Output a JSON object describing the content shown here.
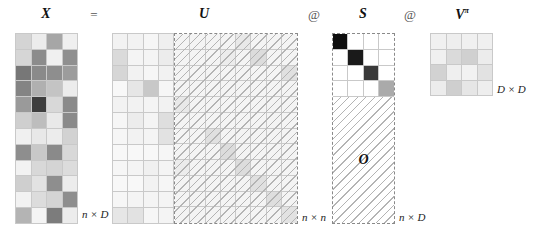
{
  "labels": {
    "X": "X",
    "equals": "=",
    "U": "U",
    "at1": "@",
    "S": "S",
    "at2": "@",
    "V": "V",
    "V_sup": "π",
    "O": "O",
    "dim_X": "n × D",
    "dim_U": "n × n",
    "dim_S": "n × D",
    "dim_V": "D × D"
  },
  "matrices": {
    "X": {
      "rows": 12,
      "cols": 4,
      "cells": [
        [
          "#d4d4d4",
          "#ececec",
          "#a6a6a6",
          "#efefef"
        ],
        [
          "#d6d6d6",
          "#8c8c8c",
          "#f0f0f0",
          "#8f8f8f"
        ],
        [
          "#777777",
          "#8a8a8a",
          "#8e8e8e",
          "#9c9c9c"
        ],
        [
          "#848484",
          "#b0b0b0",
          "#c4c4c4",
          "#ececec"
        ],
        [
          "#9a9a9a",
          "#3e3e3e",
          "#d8d8d8",
          "#8a8a8a"
        ],
        [
          "#cfcfcf",
          "#bdbdbd",
          "#e9e9e9",
          "#8a8a8a"
        ],
        [
          "#f0f0f0",
          "#e8e8e8",
          "#ececec",
          "#d2d2d2"
        ],
        [
          "#8e8e8e",
          "#c8c8c8",
          "#8a8a8a",
          "#d8d8d8"
        ],
        [
          "#f2f2f2",
          "#d8d8d8",
          "#d4d4d4",
          "#dcdcdc"
        ],
        [
          "#cfcfcf",
          "#e2e2e2",
          "#8e8e8e",
          "#ececec"
        ],
        [
          "#f2f2f2",
          "#dcdcdc",
          "#d4d4d4",
          "#8e8e8e"
        ],
        [
          "#b4b4b4",
          "#f4f4f4",
          "#7c7c7c",
          "#ececec"
        ]
      ]
    },
    "U_left": {
      "rows": 12,
      "cols": 4,
      "cells": [
        [
          "#f2f2f2",
          "#f2f2f2",
          "#f6f6f6",
          "#efefef"
        ],
        [
          "#dadada",
          "#f4f4f4",
          "#f4f4f4",
          "#ececec"
        ],
        [
          "#d6d6d6",
          "#f2f2f2",
          "#f6f6f6",
          "#f2f2f2"
        ],
        [
          "#f8f8f8",
          "#e6e6e6",
          "#c8c8c8",
          "#f6f6f6"
        ],
        [
          "#f2f2f2",
          "#f2f2f2",
          "#f4f4f4",
          "#f2f2f2"
        ],
        [
          "#f6f6f6",
          "#ececec",
          "#f4f4f4",
          "#dedede"
        ],
        [
          "#f6f6f6",
          "#f2f2f2",
          "#f4f4f4",
          "#e2e2e2"
        ],
        [
          "#f8f8f8",
          "#f8f8f8",
          "#f8f8f8",
          "#f6f6f6"
        ],
        [
          "#f6f6f6",
          "#f4f4f4",
          "#f0f0f0",
          "#f4f4f4"
        ],
        [
          "#f8f8f8",
          "#f8f8f8",
          "#f2f2f2",
          "#f6f6f6"
        ],
        [
          "#f6f6f6",
          "#f4f4f4",
          "#f4f4f4",
          "#f4f4f4"
        ],
        [
          "#e6e6e6",
          "#e2e2e2",
          "#f6f6f6",
          "#f4f4f4"
        ]
      ]
    },
    "U_right": {
      "rows": 12,
      "cols": 8,
      "cells": [
        [
          "#f4f4f4",
          "#f4f4f4",
          "#f4f4f4",
          "#f4f4f4",
          "#e8e8e8",
          "#f4f4f4",
          "#f4f4f4",
          "#f4f4f4"
        ],
        [
          "#f4f4f4",
          "#f4f4f4",
          "#f4f4f4",
          "#ececec",
          "#f4f4f4",
          "#dcdcdc",
          "#f4f4f4",
          "#f4f4f4"
        ],
        [
          "#f4f4f4",
          "#f4f4f4",
          "#f4f4f4",
          "#f4f4f4",
          "#f4f4f4",
          "#f4f4f4",
          "#f4f4f4",
          "#e0e0e0"
        ],
        [
          "#f4f4f4",
          "#f4f4f4",
          "#f4f4f4",
          "#f4f4f4",
          "#f4f4f4",
          "#f4f4f4",
          "#f4f4f4",
          "#f4f4f4"
        ],
        [
          "#e8e8e8",
          "#f4f4f4",
          "#f4f4f4",
          "#f4f4f4",
          "#f4f4f4",
          "#f4f4f4",
          "#f4f4f4",
          "#f4f4f4"
        ],
        [
          "#f4f4f4",
          "#f4f4f4",
          "#f4f4f4",
          "#f4f4f4",
          "#f4f4f4",
          "#f4f4f4",
          "#f4f4f4",
          "#f4f4f4"
        ],
        [
          "#f4f4f4",
          "#f4f4f4",
          "#e0e0e0",
          "#f4f4f4",
          "#f4f4f4",
          "#f4f4f4",
          "#f4f4f4",
          "#f4f4f4"
        ],
        [
          "#f4f4f4",
          "#f4f4f4",
          "#f4f4f4",
          "#dcdcdc",
          "#f4f4f4",
          "#f4f4f4",
          "#f4f4f4",
          "#f4f4f4"
        ],
        [
          "#ececec",
          "#f4f4f4",
          "#f4f4f4",
          "#f4f4f4",
          "#dcdcdc",
          "#f4f4f4",
          "#f4f4f4",
          "#f4f4f4"
        ],
        [
          "#f4f4f4",
          "#f4f4f4",
          "#f4f4f4",
          "#f4f4f4",
          "#f4f4f4",
          "#e0e0e0",
          "#f4f4f4",
          "#f4f4f4"
        ],
        [
          "#f4f4f4",
          "#f4f4f4",
          "#f4f4f4",
          "#f4f4f4",
          "#f4f4f4",
          "#f4f4f4",
          "#dedede",
          "#f4f4f4"
        ],
        [
          "#f4f4f4",
          "#f4f4f4",
          "#f4f4f4",
          "#f4f4f4",
          "#f4f4f4",
          "#f4f4f4",
          "#f4f4f4",
          "#e2e2e2"
        ]
      ]
    },
    "S": {
      "rows": 4,
      "cols": 4,
      "cells": [
        [
          "#0e0e0e",
          "#ffffff",
          "#ffffff",
          "#ffffff"
        ],
        [
          "#ffffff",
          "#1a1a1a",
          "#ffffff",
          "#ffffff"
        ],
        [
          "#ffffff",
          "#ffffff",
          "#3a3a3a",
          "#ffffff"
        ],
        [
          "#ffffff",
          "#ffffff",
          "#ffffff",
          "#aaaaaa"
        ]
      ]
    },
    "V": {
      "rows": 4,
      "cols": 4,
      "cells": [
        [
          "#f0f0f0",
          "#eeeeee",
          "#f0f0f0",
          "#f0f0f0"
        ],
        [
          "#f0f0f0",
          "#dadada",
          "#d0d0d0",
          "#ececec"
        ],
        [
          "#d2d2d2",
          "#efefef",
          "#f2f2f2",
          "#e2e2e2"
        ],
        [
          "#ececec",
          "#cfcfcf",
          "#e6e6e6",
          "#eeeeee"
        ]
      ]
    }
  }
}
